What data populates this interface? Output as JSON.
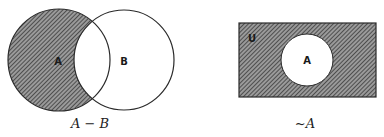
{
  "diagrams": [
    {
      "id": "difference",
      "caption": "A − B",
      "sets": [
        {
          "label": "A",
          "shaded": true
        },
        {
          "label": "B",
          "shaded": false
        }
      ]
    },
    {
      "id": "complement",
      "caption": "~A",
      "universe_label": "U",
      "sets": [
        {
          "label": "A",
          "shaded": false
        }
      ]
    }
  ],
  "colors": {
    "stroke": "#2a2a2a",
    "hatch": "#3a3a3a",
    "background": "#ffffff"
  }
}
